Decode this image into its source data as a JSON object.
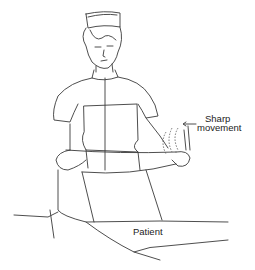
{
  "figure": {
    "labels": {
      "sharp_line1": "Sharp",
      "sharp_line2": "movement",
      "patient": "Patient"
    },
    "colors": {
      "background": "#ffffff",
      "line": "#3a3a3a"
    }
  }
}
